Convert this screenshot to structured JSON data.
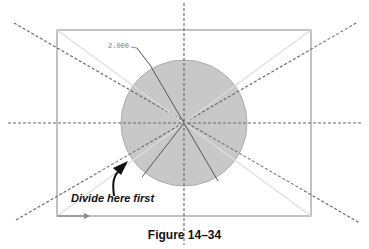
{
  "figure": {
    "caption": "Figure 14–34",
    "callout": "Divide here first",
    "dimension": "2.000",
    "colors": {
      "circle_fill": "#c8c8c8",
      "lines": "#666666",
      "rect": "#999999",
      "text": "#111111"
    }
  }
}
